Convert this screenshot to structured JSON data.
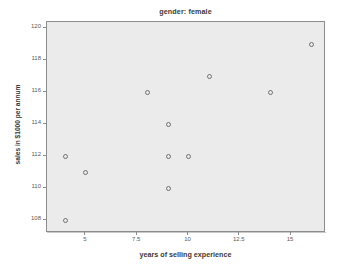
{
  "chart_data": {
    "type": "scatter",
    "title": "gender: female",
    "xlabel": "years of selling experience",
    "ylabel": "sales in $1000 per annum",
    "xlim": [
      3.1,
      16.7
    ],
    "ylim": [
      107.2,
      120.4
    ],
    "xticks": [
      "5",
      "7.5",
      "10",
      "12.5",
      "15"
    ],
    "xtick_values": [
      5,
      7.5,
      10,
      12.5,
      15
    ],
    "yticks": [
      "108",
      "110",
      "112",
      "114",
      "116",
      "118",
      "120"
    ],
    "ytick_values": [
      108,
      110,
      112,
      114,
      116,
      118,
      120
    ],
    "grid": false,
    "legend": null,
    "series": [
      {
        "name": "female",
        "marker": "open-circle",
        "color": "#6e6e6e",
        "points": [
          {
            "x": 4,
            "y": 112
          },
          {
            "x": 4,
            "y": 108
          },
          {
            "x": 5,
            "y": 111
          },
          {
            "x": 8,
            "y": 116
          },
          {
            "x": 9,
            "y": 114
          },
          {
            "x": 9,
            "y": 112
          },
          {
            "x": 9,
            "y": 110
          },
          {
            "x": 10,
            "y": 112
          },
          {
            "x": 11,
            "y": 117
          },
          {
            "x": 14,
            "y": 116
          },
          {
            "x": 16,
            "y": 119
          }
        ]
      }
    ],
    "colors": {
      "plot_background": "#ebebeb",
      "frame_border": "#8c8c8c",
      "marker_stroke": "#6e6e6e",
      "text": "#3a3a3a",
      "tick_text": "#5a5a5a",
      "page_background": "#ffffff"
    }
  }
}
